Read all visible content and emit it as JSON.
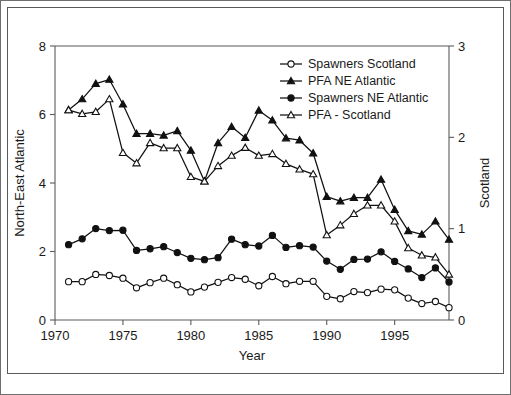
{
  "figure": {
    "background_color": "#ffffff",
    "border_color": "#5a5a5a",
    "line_color": "#111111"
  },
  "chart_data": {
    "type": "line",
    "title": "",
    "xlabel": "Year",
    "ylabel": "North-East Atlantic",
    "y2label": "Scotland",
    "xlim": [
      1970,
      1999
    ],
    "ylim": [
      0,
      8
    ],
    "y2lim": [
      0,
      3
    ],
    "xticks": [
      1970,
      1975,
      1980,
      1985,
      1990,
      1995
    ],
    "yticks": [
      0,
      2,
      4,
      6,
      8
    ],
    "y2ticks": [
      0,
      1,
      2,
      3
    ],
    "grid": false,
    "legend_position": "top-right",
    "x": [
      1971,
      1972,
      1973,
      1974,
      1975,
      1976,
      1977,
      1978,
      1979,
      1980,
      1981,
      1982,
      1983,
      1984,
      1985,
      1986,
      1987,
      1988,
      1989,
      1990,
      1991,
      1992,
      1993,
      1994,
      1995,
      1996,
      1997,
      1998,
      1999
    ],
    "series": [
      {
        "name": "Spawners Scotland",
        "axis": "right",
        "marker": "open-circle",
        "values": [
          0.42,
          0.42,
          0.5,
          0.49,
          0.46,
          0.35,
          0.41,
          0.46,
          0.39,
          0.31,
          0.36,
          0.41,
          0.47,
          0.45,
          0.38,
          0.48,
          0.4,
          0.43,
          0.43,
          0.26,
          0.23,
          0.31,
          0.3,
          0.34,
          0.33,
          0.24,
          0.18,
          0.2,
          0.14
        ],
        "values_left_scale": [
          1.12,
          1.12,
          1.33,
          1.3,
          1.22,
          0.94,
          1.09,
          1.22,
          1.03,
          0.82,
          0.96,
          1.1,
          1.24,
          1.19,
          1.0,
          1.27,
          1.06,
          1.13,
          1.13,
          0.69,
          0.62,
          0.83,
          0.8,
          0.9,
          0.88,
          0.64,
          0.48,
          0.54,
          0.36
        ]
      },
      {
        "name": "PFA NE Atlantic",
        "axis": "left",
        "marker": "filled-triangle",
        "values": [
          6.13,
          6.45,
          6.9,
          7.02,
          6.3,
          5.44,
          5.44,
          5.39,
          5.52,
          4.95,
          4.05,
          5.17,
          5.64,
          5.32,
          6.12,
          5.83,
          5.31,
          5.25,
          4.87,
          3.6,
          3.47,
          3.57,
          3.57,
          4.1,
          3.22,
          2.6,
          2.5,
          2.88,
          2.35
        ]
      },
      {
        "name": "Spawners NE Atlantic",
        "axis": "left",
        "marker": "filled-circle",
        "values": [
          2.2,
          2.37,
          2.67,
          2.61,
          2.62,
          2.03,
          2.08,
          2.14,
          1.97,
          1.8,
          1.76,
          1.82,
          2.36,
          2.2,
          2.16,
          2.47,
          2.12,
          2.17,
          2.13,
          1.72,
          1.48,
          1.77,
          1.78,
          1.99,
          1.71,
          1.49,
          1.24,
          1.52,
          1.11
        ]
      },
      {
        "name": "PFA - Scotland",
        "axis": "right",
        "marker": "open-triangle",
        "values": [
          2.3,
          2.26,
          2.28,
          2.42,
          1.83,
          1.72,
          1.94,
          1.88,
          1.88,
          1.57,
          1.52,
          1.69,
          1.8,
          1.89,
          1.8,
          1.82,
          1.71,
          1.65,
          1.6,
          0.93,
          1.04,
          1.16,
          1.26,
          1.26,
          1.08,
          0.79,
          0.71,
          0.69,
          0.5
        ],
        "values_left_scale": [
          6.13,
          6.02,
          6.08,
          6.45,
          4.88,
          4.58,
          5.17,
          5.02,
          5.02,
          4.18,
          4.05,
          4.5,
          4.8,
          5.03,
          4.8,
          4.85,
          4.56,
          4.4,
          4.26,
          2.48,
          2.77,
          3.1,
          3.35,
          3.35,
          2.88,
          2.1,
          1.89,
          1.83,
          1.33
        ]
      }
    ]
  },
  "legend": {
    "items": [
      {
        "label": "Spawners Scotland",
        "marker": "open-circle"
      },
      {
        "label": "PFA NE Atlantic",
        "marker": "filled-triangle"
      },
      {
        "label": "Spawners NE Atlantic",
        "marker": "filled-circle"
      },
      {
        "label": "PFA - Scotland",
        "marker": "open-triangle"
      }
    ]
  }
}
